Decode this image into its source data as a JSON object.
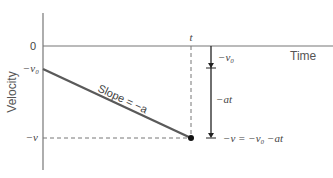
{
  "diagram": {
    "y_axis_label": "Velocity",
    "x_axis_label": "Time",
    "zero_label": "0",
    "v0_label": "−v₀",
    "v_label": "−v",
    "t_label": "t",
    "slope_label": "Slope = −a",
    "arrow_top_label": "−v₀",
    "arrow_mid_label": "−at",
    "equation_label": "−v = −v₀ −at",
    "colors": {
      "axis": "#777777",
      "line": "#5a5a5a",
      "text": "#444444",
      "arrow": "#222222"
    }
  }
}
